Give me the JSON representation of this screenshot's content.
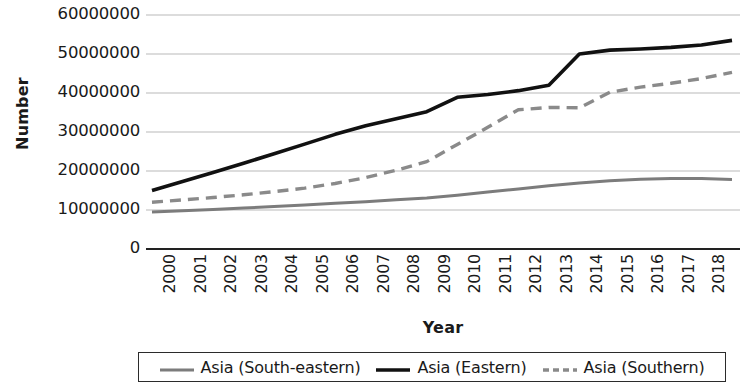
{
  "chart_data": {
    "type": "line",
    "title": "",
    "xlabel": "Year",
    "ylabel": "Number",
    "grid": true,
    "legend_position": "bottom",
    "xlim": [
      2000,
      2019
    ],
    "ylim": [
      0,
      60000000
    ],
    "yticks": [
      0,
      10000000,
      20000000,
      30000000,
      40000000,
      50000000,
      60000000
    ],
    "ytick_labels": [
      "0",
      "10000000",
      "20000000",
      "30000000",
      "40000000",
      "50000000",
      "60000000"
    ],
    "x": [
      2000,
      2001,
      2002,
      2003,
      2004,
      2005,
      2006,
      2007,
      2008,
      2009,
      2010,
      2011,
      2012,
      2013,
      2014,
      2015,
      2016,
      2017,
      2018,
      2019
    ],
    "xtick_labels": [
      "2000",
      "2001",
      "2002",
      "2003",
      "2004",
      "2005",
      "2006",
      "2007",
      "2008",
      "2009",
      "2010",
      "2011",
      "2012",
      "2013",
      "2014",
      "2015",
      "2016",
      "2017",
      "2018",
      "2019"
    ],
    "series": [
      {
        "name": "Asia (South-eastern)",
        "style": "solid",
        "color": "#7c7c7c",
        "width": 3,
        "values": [
          9500000,
          9800000,
          10100000,
          10500000,
          10900000,
          11300000,
          11700000,
          12100000,
          12600000,
          13100000,
          13800000,
          14600000,
          15400000,
          16200000,
          16900000,
          17500000,
          17900000,
          18100000,
          18100000,
          17800000
        ]
      },
      {
        "name": "Asia (Eastern)",
        "style": "solid",
        "color": "#111111",
        "width": 3.6,
        "values": [
          15000000,
          17300000,
          19600000,
          22000000,
          24400000,
          26900000,
          29400000,
          31600000,
          33400000,
          35200000,
          38900000,
          39600000,
          40600000,
          42000000,
          50000000,
          51000000,
          51300000,
          51700000,
          52300000,
          53500000
        ]
      },
      {
        "name": "Asia (Southern)",
        "style": "dashed",
        "color": "#8a8a8a",
        "width": 3.4,
        "values": [
          12000000,
          12600000,
          13200000,
          13900000,
          14700000,
          15600000,
          16800000,
          18300000,
          20200000,
          22400000,
          26800000,
          31200000,
          35700000,
          36300000,
          36200000,
          40200000,
          41500000,
          42500000,
          43700000,
          45300000
        ]
      }
    ]
  },
  "legend": {
    "items": [
      {
        "label": "Asia (South-eastern)",
        "icon": "line-solid-gray-icon"
      },
      {
        "label": "Asia (Eastern)",
        "icon": "line-solid-black-icon"
      },
      {
        "label": "Asia (Southern)",
        "icon": "line-dashed-gray-icon"
      }
    ]
  }
}
